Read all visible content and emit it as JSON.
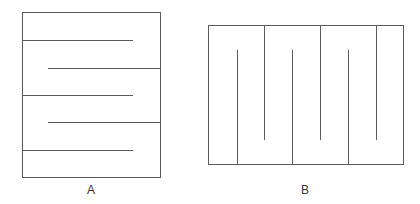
{
  "diagram": {
    "stroke_color": "#5a5a5a",
    "figures": [
      {
        "id": "A",
        "label": "A",
        "orientation": "horizontal",
        "frame": {
          "x": 22,
          "y": 12,
          "width": 138,
          "height": 165
        },
        "baffles": [
          {
            "from": "left",
            "y": 40,
            "x1": 22,
            "x2": 133
          },
          {
            "from": "right",
            "y": 68,
            "x1": 48,
            "x2": 160
          },
          {
            "from": "left",
            "y": 95,
            "x1": 22,
            "x2": 133
          },
          {
            "from": "right",
            "y": 122,
            "x1": 48,
            "x2": 160
          },
          {
            "from": "left",
            "y": 150,
            "x1": 22,
            "x2": 133
          }
        ]
      },
      {
        "id": "B",
        "label": "B",
        "orientation": "vertical",
        "frame": {
          "x": 208,
          "y": 25,
          "width": 195,
          "height": 139
        },
        "baffles": [
          {
            "from": "bottom",
            "x": 237,
            "y1": 50,
            "y2": 164
          },
          {
            "from": "top",
            "x": 264,
            "y1": 25,
            "y2": 140
          },
          {
            "from": "bottom",
            "x": 292,
            "y1": 50,
            "y2": 164
          },
          {
            "from": "top",
            "x": 320,
            "y1": 25,
            "y2": 140
          },
          {
            "from": "bottom",
            "x": 348,
            "y1": 50,
            "y2": 164
          },
          {
            "from": "top",
            "x": 376,
            "y1": 25,
            "y2": 140
          }
        ]
      }
    ]
  },
  "labels": {
    "a": "A",
    "b": "B"
  }
}
